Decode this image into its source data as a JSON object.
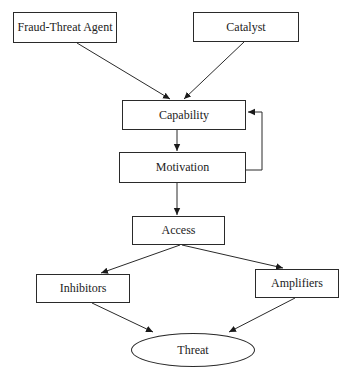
{
  "diagram": {
    "type": "flowchart",
    "nodes": {
      "fraud_threat_agent": "Fraud-Threat Agent",
      "catalyst": "Catalyst",
      "capability": "Capability",
      "motivation": "Motivation",
      "access": "Access",
      "inhibitors": "Inhibitors",
      "amplifiers": "Amplifiers",
      "threat": "Threat"
    },
    "edges": [
      {
        "from": "Fraud-Threat Agent",
        "to": "Capability"
      },
      {
        "from": "Catalyst",
        "to": "Capability"
      },
      {
        "from": "Capability",
        "to": "Motivation"
      },
      {
        "from": "Motivation",
        "to": "Capability"
      },
      {
        "from": "Motivation",
        "to": "Access"
      },
      {
        "from": "Access",
        "to": "Inhibitors"
      },
      {
        "from": "Access",
        "to": "Amplifiers"
      },
      {
        "from": "Inhibitors",
        "to": "Threat"
      },
      {
        "from": "Amplifiers",
        "to": "Threat"
      }
    ],
    "colors": {
      "stroke": "#2a2a2a",
      "background": "#ffffff",
      "text": "#222222"
    }
  }
}
